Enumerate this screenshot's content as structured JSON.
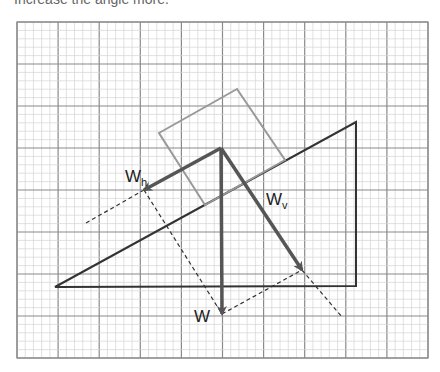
{
  "caption": "Increase the angle more.",
  "diagram": {
    "grid": {
      "x0": 17,
      "y0": 22,
      "x1": 428,
      "y1": 358,
      "major_x": 41.1,
      "major_y": 42,
      "minor_divisions": 5,
      "major_color": "#8a8a8a",
      "minor_color": "#d4d4d4"
    },
    "incline": {
      "points": [
        [
          55,
          287
        ],
        [
          356,
          122
        ],
        [
          356,
          286
        ]
      ],
      "color": "#333333"
    },
    "block": {
      "points": [
        [
          237,
          89
        ],
        [
          159,
          133
        ],
        [
          205,
          205
        ],
        [
          285,
          160
        ]
      ],
      "color": "#999999"
    },
    "origin": [
      221,
      148
    ],
    "vectors": [
      {
        "name": "W",
        "label": "W",
        "subscript": "",
        "tip": [
          222,
          314
        ],
        "label_pos": [
          194,
          322
        ]
      },
      {
        "name": "Wh",
        "label": "W",
        "subscript": "h",
        "tip": [
          144,
          190
        ],
        "label_pos": [
          125,
          182
        ]
      },
      {
        "name": "Wv",
        "label": "W",
        "subscript": "v",
        "tip": [
          302,
          270
        ],
        "label_pos": [
          266,
          205
        ]
      }
    ],
    "vector_color": "#555555",
    "dashed_lines": [
      {
        "from": [
          86,
          223
        ],
        "to": [
          144,
          190
        ]
      },
      {
        "from": [
          144,
          190
        ],
        "to": [
          222,
          314
        ]
      },
      {
        "from": [
          222,
          314
        ],
        "to": [
          302,
          270
        ]
      },
      {
        "from": [
          302,
          270
        ],
        "to": [
          342,
          317
        ]
      }
    ]
  }
}
